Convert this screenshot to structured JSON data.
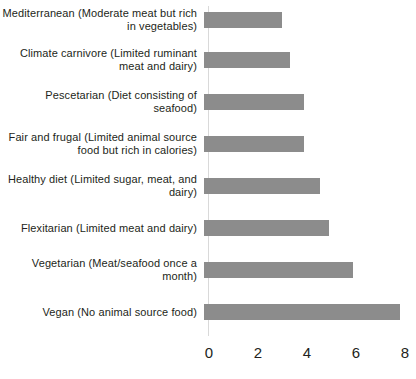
{
  "chart_data": {
    "type": "bar",
    "orientation": "horizontal",
    "title": "",
    "subtitle": "",
    "xlabel": "",
    "ylabel": "",
    "xlim": [
      0,
      8
    ],
    "xticks": [
      0,
      2,
      4,
      6,
      8
    ],
    "xtick_labels": [
      "0",
      "2",
      "4",
      "6",
      "8"
    ],
    "grid": false,
    "legend": null,
    "bar_color": "#8c8c8c",
    "background_color": "#ffffff",
    "text_color": "#231f20",
    "categories": [
      "Mediterranean (Moderate meat but rich in vegetables)",
      "Climate carnivore (Limited ruminant meat and dairy)",
      "Pescetarian (Diet consisting of seafood)",
      "Fair and frugal (Limited animal source food but rich in calories)",
      "Healthy diet (Limited sugar, meat, and dairy)",
      "Flexitarian (Limited meat and dairy)",
      "Vegetarian (Meat/seafood once a month)",
      "Vegan (No animal source food)"
    ],
    "values": [
      3.2,
      3.5,
      4.1,
      4.1,
      4.75,
      5.1,
      6.1,
      8.0
    ]
  }
}
